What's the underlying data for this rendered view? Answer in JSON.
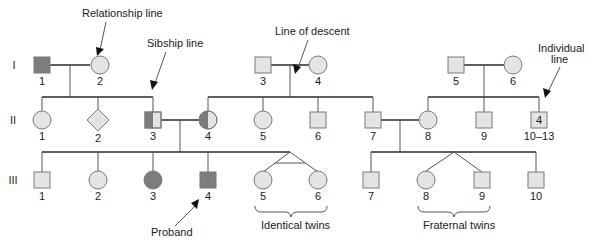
{
  "colors": {
    "unaffected_fill": "#e4e4e4",
    "affected_fill": "#7d7d7d",
    "outline": "#7a7a7a",
    "line": "#2a2a2a"
  },
  "generations": [
    {
      "label": "I",
      "y": 65
    },
    {
      "label": "II",
      "y": 120
    },
    {
      "label": "III",
      "y": 180
    }
  ],
  "individuals": {
    "gen1": [
      {
        "id": "1",
        "shape": "square",
        "status": "affected",
        "x": 42
      },
      {
        "id": "2",
        "shape": "circle",
        "status": "unaffected",
        "x": 100
      },
      {
        "id": "3",
        "shape": "square",
        "status": "unaffected",
        "x": 263
      },
      {
        "id": "4",
        "shape": "circle",
        "status": "unaffected",
        "x": 318
      },
      {
        "id": "5",
        "shape": "square",
        "status": "unaffected",
        "x": 456
      },
      {
        "id": "6",
        "shape": "circle",
        "status": "unaffected",
        "x": 513
      }
    ],
    "gen2": [
      {
        "id": "1",
        "shape": "circle",
        "status": "unaffected",
        "x": 42
      },
      {
        "id": "2",
        "shape": "diamond",
        "status": "unaffected",
        "x": 98
      },
      {
        "id": "3",
        "shape": "square",
        "status": "carrier",
        "x": 153
      },
      {
        "id": "4",
        "shape": "circle",
        "status": "carrier",
        "x": 208
      },
      {
        "id": "5",
        "shape": "circle",
        "status": "unaffected",
        "x": 263
      },
      {
        "id": "6",
        "shape": "square",
        "status": "unaffected",
        "x": 318
      },
      {
        "id": "7",
        "shape": "square",
        "status": "unaffected",
        "x": 373
      },
      {
        "id": "8",
        "shape": "circle",
        "status": "unaffected",
        "x": 428
      },
      {
        "id": "9",
        "shape": "square",
        "status": "unaffected",
        "x": 484
      },
      {
        "id": "10–13",
        "shape": "square",
        "status": "unaffected",
        "x": 539,
        "inner_count": "4"
      }
    ],
    "gen3": [
      {
        "id": "1",
        "shape": "square",
        "status": "unaffected",
        "x": 42
      },
      {
        "id": "2",
        "shape": "circle",
        "status": "unaffected",
        "x": 98
      },
      {
        "id": "3",
        "shape": "circle",
        "status": "affected",
        "x": 153
      },
      {
        "id": "4",
        "shape": "square",
        "status": "affected",
        "x": 208,
        "proband": true
      },
      {
        "id": "5",
        "shape": "circle",
        "status": "unaffected",
        "x": 263,
        "twin": "identical"
      },
      {
        "id": "6",
        "shape": "circle",
        "status": "unaffected",
        "x": 318,
        "twin": "identical"
      },
      {
        "id": "7",
        "shape": "square",
        "status": "unaffected",
        "x": 371
      },
      {
        "id": "8",
        "shape": "circle",
        "status": "unaffected",
        "x": 426,
        "twin": "fraternal"
      },
      {
        "id": "9",
        "shape": "square",
        "status": "unaffected",
        "x": 482,
        "twin": "fraternal"
      },
      {
        "id": "10",
        "shape": "square",
        "status": "unaffected",
        "x": 536
      }
    ]
  },
  "annotations": {
    "relationship_line": "Relationship line",
    "sibship_line": "Sibship line",
    "line_of_descent": "Line of descent",
    "individual_line_1": "Individual",
    "individual_line_2": "line",
    "proband": "Proband",
    "identical_twins": "Identical twins",
    "fraternal_twins": "Fraternal twins"
  }
}
